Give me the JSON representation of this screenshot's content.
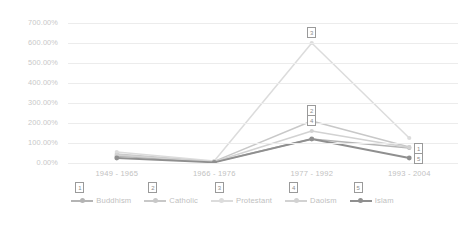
{
  "chart_data": {
    "type": "line",
    "title": "",
    "xlabel": "",
    "ylabel": "",
    "categories": [
      "1949 - 1965",
      "1966 - 1976",
      "1977 - 1992",
      "1993 - 2004"
    ],
    "ylim": [
      0,
      700
    ],
    "ytick_labels": [
      "700.00%",
      "600.00%",
      "500.00%",
      "400.00%",
      "300.00%",
      "200.00%",
      "100.00%",
      "0.00%"
    ],
    "ytick_values": [
      700,
      600,
      500,
      400,
      300,
      200,
      100,
      0
    ],
    "grid": true,
    "legend_position": "bottom",
    "series": [
      {
        "name": "Buddhism",
        "badge": "1",
        "color": "#b4b4b4",
        "values": [
          35,
          5,
          120,
          75
        ]
      },
      {
        "name": "Catholic",
        "badge": "2",
        "color": "#c8c8c8",
        "values": [
          45,
          8,
          210,
          80
        ]
      },
      {
        "name": "Protestant",
        "badge": "3",
        "color": "#dcdcdc",
        "values": [
          55,
          10,
          600,
          125
        ]
      },
      {
        "name": "Daoism",
        "badge": "4",
        "color": "#d2d2d2",
        "values": [
          40,
          6,
          160,
          78
        ]
      },
      {
        "name": "Islam",
        "badge": "5",
        "color": "#8f8f8f",
        "values": [
          25,
          3,
          120,
          25
        ]
      }
    ],
    "annotations": [
      {
        "label": "3",
        "series": "Protestant",
        "at": "1977 - 1992"
      },
      {
        "label": "2",
        "series": "Catholic",
        "at": "1977 - 1992"
      },
      {
        "label": "4",
        "series": "Daoism",
        "at": "1977 - 1992"
      },
      {
        "label": "1",
        "series": "Buddhism",
        "at": "1993 - 2004"
      },
      {
        "label": "5",
        "series": "Islam",
        "at": "1993 - 2004"
      }
    ]
  }
}
